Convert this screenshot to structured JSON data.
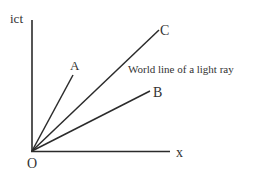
{
  "diagram": {
    "type": "minkowski-spacetime-diagram",
    "axes": {
      "vertical_label": "ict",
      "horizontal_label": "x",
      "origin_label": "O"
    },
    "lines": [
      {
        "id": "A",
        "label": "A"
      },
      {
        "id": "C",
        "label": "C"
      },
      {
        "id": "B",
        "label": "B"
      }
    ],
    "annotation": "World line of a light ray",
    "colors": {
      "line": "#2b2b2b",
      "text": "#333333",
      "background": "#ffffff"
    }
  }
}
